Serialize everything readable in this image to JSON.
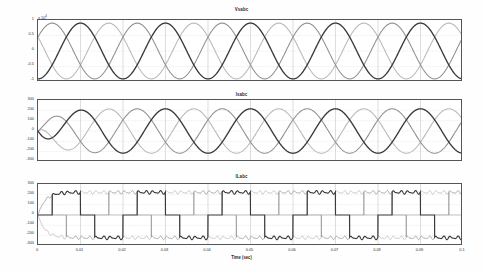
{
  "figure": {
    "width": 483,
    "height": 272,
    "background": "#ffffff",
    "xlabel": "Time (sec)"
  },
  "colors": {
    "phase_a": "#3a3a3a",
    "phase_b": "#8f8f8f",
    "phase_c": "#b8b8b8",
    "axis": "#555555",
    "grid": "#c9c9c9",
    "text": "#2a2a2a"
  },
  "chart_data": [
    {
      "type": "line",
      "title": "Vsabc",
      "xlabel": "",
      "ylabel": "",
      "y_exponent_label": "x 10",
      "y_exponent_value": "4",
      "xlim": [
        0,
        0.1
      ],
      "ylim": [
        -1,
        1
      ],
      "xticks": [
        0,
        0.01,
        0.02,
        0.03,
        0.04,
        0.05,
        0.06,
        0.07,
        0.08,
        0.09,
        0.1
      ],
      "xticklabels": [
        "0",
        "0.01",
        "0.02",
        "0.03",
        "0.04",
        "0.05",
        "0.06",
        "0.07",
        "0.08",
        "0.09",
        "0.1"
      ],
      "yticks": [
        1,
        0.5,
        0,
        -0.5,
        -1
      ],
      "yticklabels": [
        "1",
        "0.5",
        "0",
        "-0.5",
        "-1"
      ],
      "grid": true,
      "legend": "none",
      "waveform": "three-phase-sine",
      "frequency_hz": 50,
      "amplitude": 0.9,
      "series": [
        {
          "name": "Vsa",
          "phase_deg": -90,
          "color": "#3a3a3a",
          "amplitude": 0.9
        },
        {
          "name": "Vsb",
          "phase_deg": 30,
          "color": "#8f8f8f",
          "amplitude": 0.9
        },
        {
          "name": "Vsc",
          "phase_deg": 150,
          "color": "#b8b8b8",
          "amplitude": 0.9
        }
      ],
      "description": "Three-phase source voltage, sinusoidal, peak approx 0.9 x 10^4 V, 50 Hz, 5 cycles over 0.1 s"
    },
    {
      "type": "line",
      "title": "Isabc",
      "xlabel": "",
      "ylabel": "",
      "xlim": [
        0,
        0.1
      ],
      "ylim": [
        -300,
        300
      ],
      "xticks": [
        0,
        0.01,
        0.02,
        0.03,
        0.04,
        0.05,
        0.06,
        0.07,
        0.08,
        0.09,
        0.1
      ],
      "xticklabels": [
        "0",
        "0.01",
        "0.02",
        "0.03",
        "0.04",
        "0.05",
        "0.06",
        "0.07",
        "0.08",
        "0.09",
        "0.1"
      ],
      "yticks": [
        300,
        200,
        100,
        0,
        -100,
        -200,
        -300
      ],
      "yticklabels": [
        "300",
        "200",
        "100",
        "0",
        "-100",
        "-200",
        "-300"
      ],
      "grid": true,
      "legend": "none",
      "waveform": "three-phase-sine",
      "frequency_hz": 50,
      "amplitude": 215,
      "series": [
        {
          "name": "Isa",
          "phase_deg": -90,
          "color": "#3a3a3a",
          "amplitude": 215
        },
        {
          "name": "Isb",
          "phase_deg": 30,
          "color": "#8f8f8f",
          "amplitude": 215
        },
        {
          "name": "Isc",
          "phase_deg": 150,
          "color": "#b8b8b8",
          "amplitude": 215
        }
      ],
      "description": "Three-phase source current, sinusoidal, peak approx 215 A, 50 Hz, starts from zero at t=0"
    },
    {
      "type": "line",
      "title": "ILabc",
      "xlabel": "Time (sec)",
      "ylabel": "",
      "xlim": [
        0,
        0.1
      ],
      "ylim": [
        -300,
        300
      ],
      "xticks": [
        0,
        0.01,
        0.02,
        0.03,
        0.04,
        0.05,
        0.06,
        0.07,
        0.08,
        0.09,
        0.1
      ],
      "xticklabels": [
        "0",
        "0.01",
        "0.02",
        "0.03",
        "0.04",
        "0.05",
        "0.06",
        "0.07",
        "0.08",
        "0.09",
        "0.1"
      ],
      "yticks": [
        300,
        200,
        100,
        0,
        -100,
        -200,
        -300
      ],
      "yticklabels": [
        "300",
        "200",
        "100",
        "0",
        "-100",
        "-200",
        "-300"
      ],
      "grid": true,
      "legend": "none",
      "waveform": "six-step-quasi-square",
      "frequency_hz": 50,
      "amplitude": 220,
      "series": [
        {
          "name": "ILa",
          "phase_deg": -90,
          "color": "#3a3a3a",
          "amplitude": 220
        },
        {
          "name": "ILb",
          "phase_deg": 30,
          "color": "#8f8f8f",
          "amplitude": 220
        },
        {
          "name": "ILc",
          "phase_deg": 150,
          "color": "#b8b8b8",
          "amplitude": 220
        }
      ],
      "description": "Three-phase non-linear load current, six-step quasi-square waveform with ripple, peak approx 220 A, 50 Hz"
    }
  ]
}
